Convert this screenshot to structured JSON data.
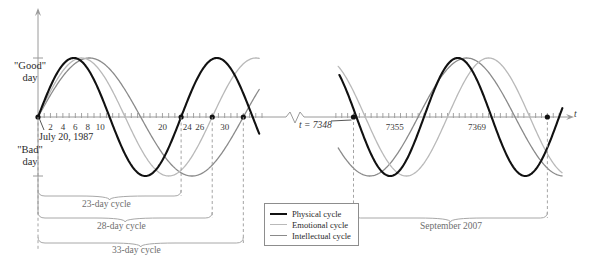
{
  "figure": {
    "axis_variable_label": "t",
    "y_labels": {
      "good": "\"Good\"\nday",
      "bad": "\"Bad\"\nday",
      "good_line1": "\"Good\"",
      "good_line2": "day",
      "bad_line1": "\"Bad\"",
      "bad_line2": "day"
    },
    "start_date_label": "July 20, 1987",
    "t_marker_label": "t = 7348",
    "right_period_label": "September 2007",
    "axis_break": true
  },
  "colors": {
    "physical": "#111111",
    "emotional": "#b9b9b9",
    "intellectual": "#8a8a8a",
    "axis": "#9a9a9a",
    "bracket": "#a8a8a8",
    "dashed": "#9a9a9a",
    "text": "#2b2b2b",
    "muted_text": "#6e6e6e",
    "background": "#ffffff"
  },
  "left_axis_ticks": [
    {
      "t": 2,
      "label": "2"
    },
    {
      "t": 4,
      "label": "4"
    },
    {
      "t": 6,
      "label": "6"
    },
    {
      "t": 8,
      "label": "8"
    },
    {
      "t": 10,
      "label": "10"
    },
    {
      "t": 20,
      "label": "20"
    },
    {
      "t": 24,
      "label": "24"
    },
    {
      "t": 26,
      "label": "26"
    },
    {
      "t": 30,
      "label": "30"
    }
  ],
  "right_axis_ticks": [
    {
      "t": 7355,
      "label": "7355"
    },
    {
      "t": 7369,
      "label": "7369"
    }
  ],
  "zero_crossing_markers_left": [
    23,
    28,
    33
  ],
  "zero_crossing_markers_right": [
    7348,
    7381
  ],
  "cycle_brackets": [
    {
      "label": "23-day cycle",
      "days": 23
    },
    {
      "label": "28-day cycle",
      "days": 28
    },
    {
      "label": "33-day cycle",
      "days": 33
    }
  ],
  "legend": {
    "items": [
      {
        "name": "Physical cycle",
        "color_key": "physical"
      },
      {
        "name": "Emotional cycle",
        "color_key": "emotional"
      },
      {
        "name": "Intellectual cycle",
        "color_key": "intellectual"
      }
    ]
  },
  "chart_data": {
    "type": "line",
    "title": "",
    "xlabel": "t",
    "ylabel": "",
    "ylim": [
      -1,
      1
    ],
    "grid": false,
    "legend_position": "bottom-center",
    "annotations": [
      "\"Good\" day",
      "\"Bad\" day",
      "July 20, 1987",
      "t = 7348",
      "September 2007",
      "23-day cycle",
      "28-day cycle",
      "33-day cycle"
    ],
    "panels": [
      {
        "name": "left-panel",
        "x_range": [
          0,
          36
        ],
        "x_ticks": [
          1,
          2,
          3,
          4,
          5,
          6,
          7,
          8,
          9,
          10,
          11,
          12,
          13,
          14,
          15,
          16,
          17,
          18,
          19,
          20,
          21,
          22,
          23,
          24,
          25,
          26,
          27,
          28,
          29,
          30,
          31,
          32,
          33,
          34,
          35,
          36
        ],
        "x_tick_labels": [
          "2",
          "4",
          "6",
          "8",
          "10",
          "20",
          "24",
          "26",
          "30"
        ],
        "marked_points_t": [
          23,
          28,
          33
        ]
      },
      {
        "name": "right-panel",
        "x_range": [
          7344,
          7384
        ],
        "x_ticks": [
          7345,
          7346,
          7347,
          7348,
          7349,
          7350,
          7351,
          7352,
          7353,
          7354,
          7355,
          7356,
          7357,
          7358,
          7359,
          7360,
          7361,
          7362,
          7363,
          7364,
          7365,
          7366,
          7367,
          7368,
          7369,
          7370,
          7371,
          7372,
          7373,
          7374,
          7375,
          7376,
          7377,
          7378,
          7379,
          7380,
          7381,
          7382,
          7383
        ],
        "x_tick_labels": [
          "7355",
          "7369"
        ],
        "marked_points_t": [
          7348,
          7381
        ]
      }
    ],
    "series": [
      {
        "name": "Physical cycle",
        "period_days": 23,
        "formula": "sin(2*pi*t/23)",
        "amplitude": 1,
        "color": "#111111"
      },
      {
        "name": "Emotional cycle",
        "period_days": 28,
        "formula": "sin(2*pi*t/28)",
        "amplitude": 1,
        "color": "#b9b9b9"
      },
      {
        "name": "Intellectual cycle",
        "period_days": 33,
        "formula": "sin(2*pi*t/33)",
        "amplitude": 1,
        "color": "#8a8a8a"
      }
    ]
  }
}
